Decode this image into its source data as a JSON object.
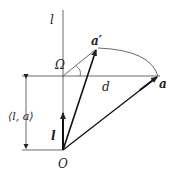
{
  "labels": {
    "axis_l": "l",
    "omega": "Ω",
    "a_prime": "a′",
    "d": "d",
    "a": "a",
    "inner_product": "⟨l, a⟩",
    "l_vec": "l",
    "origin": "O"
  },
  "colors": {
    "stroke": "#222222",
    "background": "#ffffff"
  }
}
